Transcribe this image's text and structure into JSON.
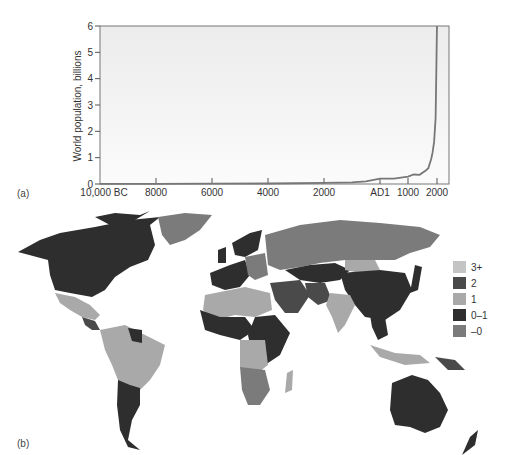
{
  "chart_data": [
    {
      "type": "line",
      "panel_label": "(a)",
      "title": "",
      "xlabel": "",
      "ylabel": "World population, billions",
      "ylim": [
        0,
        6
      ],
      "yticks": [
        "0",
        "1",
        "2",
        "3",
        "4",
        "5",
        "6"
      ],
      "xticks": [
        "10,000 BC",
        "8000",
        "6000",
        "4000",
        "2000",
        "AD1",
        "1000",
        "2000"
      ],
      "grid": false,
      "series": [
        {
          "name": "World population",
          "x": [
            -10000,
            -8000,
            -6000,
            -4000,
            -2000,
            -1000,
            -500,
            1,
            500,
            1000,
            1200,
            1400,
            1600,
            1700,
            1800,
            1850,
            1900,
            1950,
            1970,
            1990,
            2000
          ],
          "values": [
            0.004,
            0.005,
            0.01,
            0.02,
            0.04,
            0.06,
            0.1,
            0.2,
            0.2,
            0.28,
            0.36,
            0.35,
            0.5,
            0.6,
            0.95,
            1.2,
            1.6,
            2.5,
            3.7,
            5.3,
            6.0
          ]
        }
      ]
    },
    {
      "type": "heatmap",
      "panel_label": "(b)",
      "title": "",
      "legend": [
        {
          "label": "3+",
          "color": "#c4c4c4"
        },
        {
          "label": "2",
          "color": "#4a4a4a"
        },
        {
          "label": "1",
          "color": "#a9a9a9"
        },
        {
          "label": "0–1",
          "color": "#2e2e2e"
        },
        {
          "label": "–0",
          "color": "#7b7b7b"
        }
      ],
      "legend_position": "right"
    }
  ],
  "legend": {
    "items": [
      {
        "label": "3+"
      },
      {
        "label": "2"
      },
      {
        "label": "1"
      },
      {
        "label": "0–1"
      },
      {
        "label": "–0"
      }
    ]
  },
  "labels": {
    "panel_a": "(a)",
    "panel_b": "(b)",
    "ylabel": "World population, billions"
  },
  "colors": {
    "c3plus": "#c4c4c4",
    "c2": "#4a4a4a",
    "c1": "#a9a9a9",
    "c01": "#2e2e2e",
    "cneg": "#7b7b7b",
    "plot_bg": "#f2f2f2",
    "line": "#777777"
  }
}
